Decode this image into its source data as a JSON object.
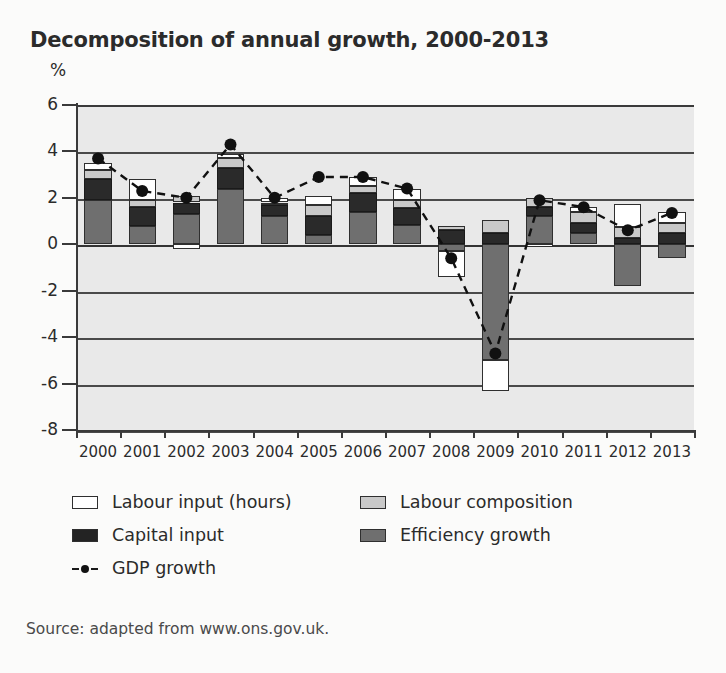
{
  "chart_data": {
    "type": "bar",
    "subtype": "stacked-bar-with-line",
    "title": "Decomposition of annual growth, 2000-2013",
    "xlabel": "",
    "ylabel": "%",
    "ylim": [
      -8,
      6
    ],
    "yticks": [
      6,
      4,
      2,
      0,
      -2,
      -4,
      -6,
      -8
    ],
    "grid": true,
    "legend_position": "below",
    "categories": [
      "2000",
      "2001",
      "2002",
      "2003",
      "2004",
      "2005",
      "2006",
      "2007",
      "2008",
      "2009",
      "2010",
      "2011",
      "2012",
      "2013"
    ],
    "series": [
      {
        "name": "Labour input (hours)",
        "color": "#ffffff",
        "values": [
          0.3,
          0.9,
          -0.2,
          0.2,
          0.2,
          0.4,
          0.4,
          0.5,
          -1.1,
          -1.3,
          -0.1,
          0.2,
          1.0,
          0.5
        ]
      },
      {
        "name": "Labour composition",
        "color": "#c9c9c9",
        "values": [
          0.4,
          0.3,
          0.3,
          0.4,
          0.1,
          0.5,
          0.3,
          0.35,
          0.2,
          0.55,
          0.4,
          0.5,
          0.5,
          0.4
        ]
      },
      {
        "name": "Capital input",
        "color": "#2a2a2a",
        "values": [
          0.9,
          0.8,
          0.5,
          0.9,
          0.5,
          0.8,
          0.8,
          0.7,
          0.6,
          0.5,
          0.4,
          0.4,
          0.25,
          0.5
        ]
      },
      {
        "name": "Efficiency growth",
        "color": "#6f6f6f",
        "values": [
          1.9,
          0.8,
          1.3,
          2.4,
          1.2,
          0.4,
          1.4,
          0.85,
          -0.3,
          -5.0,
          1.2,
          0.5,
          -1.8,
          -0.6
        ]
      }
    ],
    "line_series": {
      "name": "GDP growth",
      "color": "#111111",
      "style": "dashed-with-markers",
      "values": [
        3.7,
        2.3,
        2.0,
        4.3,
        2.0,
        2.9,
        2.9,
        2.4,
        -0.6,
        -4.7,
        1.9,
        1.6,
        0.6,
        1.35
      ]
    },
    "annotations": []
  },
  "legend": {
    "items": [
      {
        "label": "Labour input (hours)",
        "swatch": "hours"
      },
      {
        "label": "Labour composition",
        "swatch": "comp"
      },
      {
        "label": "Capital input",
        "swatch": "cap"
      },
      {
        "label": "Efficiency growth",
        "swatch": "eff"
      },
      {
        "label": "GDP growth",
        "swatch": "line"
      }
    ]
  },
  "source": {
    "text": "Source: adapted from www.ons.gov.uk."
  }
}
